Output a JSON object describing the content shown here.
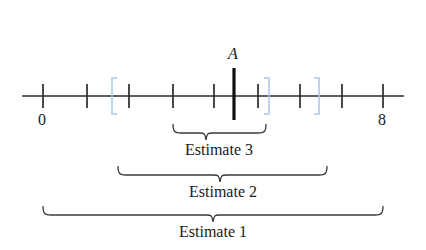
{
  "figure": {
    "type": "number-line-diagram",
    "axis": {
      "start_label": "0",
      "end_label": "8",
      "start_value": 0,
      "end_value": 8,
      "tick_count": 9,
      "tick_values": [
        0,
        1,
        2,
        3,
        4,
        5,
        6,
        7,
        8
      ],
      "line_color": "#2b2b2b",
      "tick_color": "#2b2b2b"
    },
    "point": {
      "label": "A",
      "value": 4.5,
      "marker_color": "#111111"
    },
    "bracket_color": "#aec6e8",
    "brackets": [
      {
        "name": "bracket-open-left",
        "glyph": "[",
        "value": 1.6
      },
      {
        "name": "bracket-close-middle",
        "glyph": "]",
        "value": 5.3
      },
      {
        "name": "bracket-close-right",
        "glyph": "]",
        "value": 6.5
      }
    ],
    "braces": [
      {
        "label": "Estimate 3",
        "from_value": 3.0,
        "to_value": 5.1
      },
      {
        "label": "Estimate 2",
        "from_value": 1.7,
        "to_value": 6.6
      },
      {
        "label": "Estimate 1",
        "from_value": 0.0,
        "to_value": 8.0
      }
    ]
  }
}
